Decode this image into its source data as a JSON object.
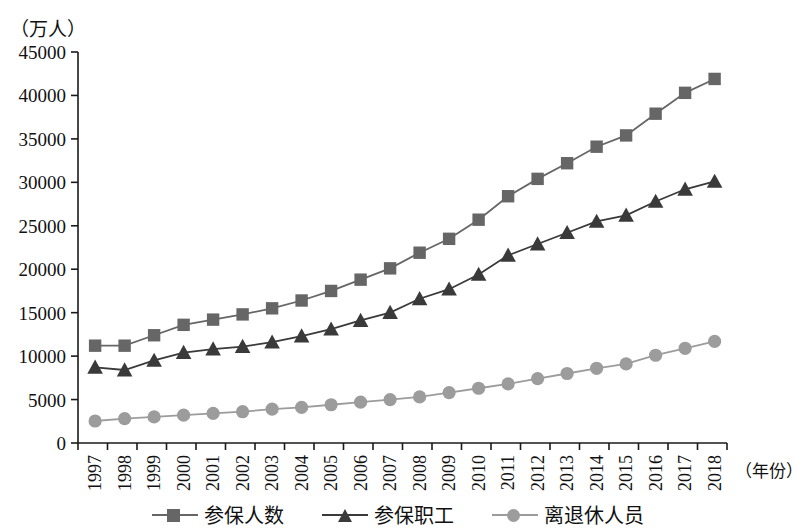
{
  "chart_data": {
    "type": "line",
    "title": "",
    "unit_label": "（万人）",
    "xlabel": "（年份）",
    "ylabel": "",
    "ylim": [
      0,
      45000
    ],
    "ytick_step": 5000,
    "yticks": [
      "0",
      "5000",
      "10000",
      "15000",
      "20000",
      "25000",
      "30000",
      "35000",
      "40000",
      "45000"
    ],
    "grid": false,
    "legend_position": "bottom-center",
    "categories": [
      "1997",
      "1998",
      "1999",
      "2000",
      "2001",
      "2002",
      "2003",
      "2004",
      "2005",
      "2006",
      "2007",
      "2008",
      "2009",
      "2010",
      "2011",
      "2012",
      "2013",
      "2014",
      "2015",
      "2016",
      "2017",
      "2018"
    ],
    "series": [
      {
        "name": "参保人数",
        "marker": "square",
        "color": "#666666",
        "values": [
          11200,
          11200,
          12400,
          13600,
          14200,
          14800,
          15500,
          16400,
          17500,
          18800,
          20100,
          21900,
          23500,
          25700,
          28400,
          30400,
          32200,
          34100,
          35400,
          37900,
          40300,
          41900
        ]
      },
      {
        "name": "参保职工",
        "marker": "triangle",
        "color": "#3a3a3a",
        "values": [
          8700,
          8400,
          9500,
          10400,
          10800,
          11100,
          11600,
          12300,
          13100,
          14100,
          15000,
          16600,
          17700,
          19400,
          21600,
          22900,
          24200,
          25500,
          26200,
          27800,
          29200,
          30100
        ]
      },
      {
        "name": "离退休人员",
        "marker": "circle",
        "color": "#9c9c9c",
        "values": [
          2530,
          2800,
          3000,
          3200,
          3400,
          3600,
          3900,
          4100,
          4400,
          4700,
          5000,
          5300,
          5800,
          6300,
          6800,
          7400,
          8000,
          8600,
          9100,
          10100,
          10900,
          11700
        ]
      }
    ]
  },
  "legend": {
    "items": [
      {
        "label": "参保人数"
      },
      {
        "label": "参保职工"
      },
      {
        "label": "离退休人员"
      }
    ]
  },
  "axis": {
    "unit": "（万人）",
    "x_title": "（年份）"
  }
}
